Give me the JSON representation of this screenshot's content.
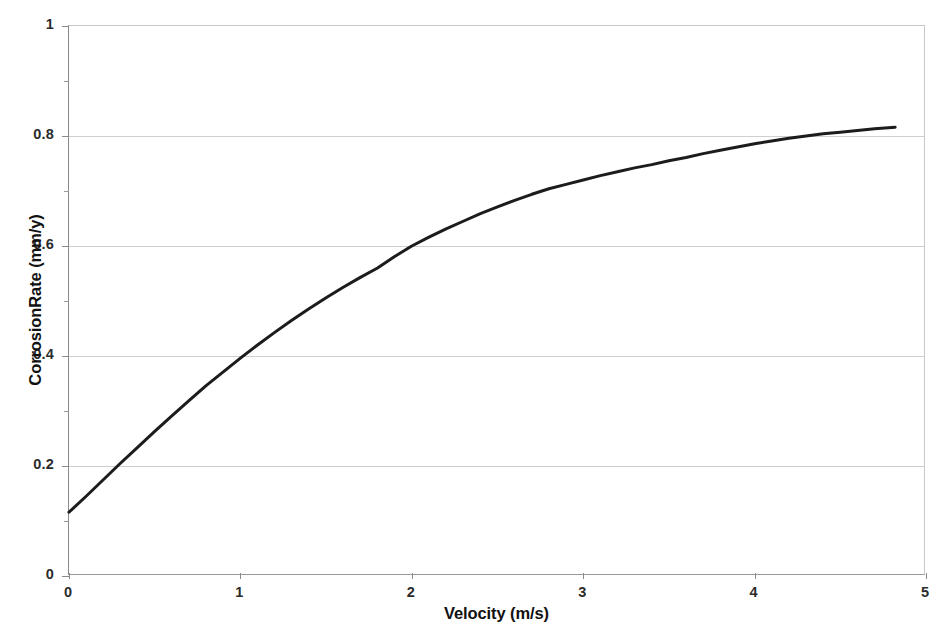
{
  "chart_data": {
    "type": "line",
    "title": "",
    "xlabel": "Velocity (m/s)",
    "ylabel": "CorrosionRate (mm/y)",
    "xlim": [
      0,
      5
    ],
    "ylim": [
      0,
      1
    ],
    "xticks": [
      "0",
      "1",
      "2",
      "3",
      "4",
      "5"
    ],
    "xtick_values": [
      0,
      1,
      2,
      3,
      4,
      5
    ],
    "yticks": [
      "0",
      "0.2",
      "0.4",
      "0.6",
      "0.8",
      "1"
    ],
    "ytick_values": [
      0,
      0.2,
      0.4,
      0.6,
      0.8,
      1
    ],
    "y_minor_ticks": [
      0.1,
      0.3,
      0.5,
      0.7,
      0.9
    ],
    "grid": "horizontal",
    "legend": "none",
    "line_color": "#1c1c1c",
    "line_width": 3,
    "grid_color": "#cfcfcf",
    "background": "#ffffff",
    "series": [
      {
        "name": "Corrosion rate vs velocity",
        "x": [
          0.0,
          0.1,
          0.2,
          0.3,
          0.4,
          0.5,
          0.6,
          0.7,
          0.8,
          0.9,
          1.0,
          1.1,
          1.2,
          1.3,
          1.4,
          1.5,
          1.6,
          1.7,
          1.8,
          1.9,
          2.0,
          2.1,
          2.2,
          2.3,
          2.4,
          2.5,
          2.6,
          2.7,
          2.8,
          2.9,
          3.0,
          3.1,
          3.2,
          3.3,
          3.4,
          3.5,
          3.6,
          3.7,
          3.8,
          3.9,
          4.0,
          4.1,
          4.2,
          4.3,
          4.4,
          4.5,
          4.6,
          4.7,
          4.82
        ],
        "y": [
          0.116,
          0.145,
          0.175,
          0.205,
          0.234,
          0.263,
          0.291,
          0.319,
          0.346,
          0.371,
          0.396,
          0.42,
          0.443,
          0.465,
          0.486,
          0.506,
          0.525,
          0.543,
          0.56,
          0.581,
          0.6,
          0.616,
          0.631,
          0.645,
          0.659,
          0.671,
          0.683,
          0.694,
          0.704,
          0.712,
          0.72,
          0.728,
          0.735,
          0.742,
          0.748,
          0.755,
          0.761,
          0.768,
          0.774,
          0.78,
          0.786,
          0.791,
          0.796,
          0.8,
          0.804,
          0.807,
          0.81,
          0.813,
          0.816
        ]
      }
    ],
    "notable_points": {
      "start": {
        "x": 0,
        "y": 0.12
      },
      "at_v1": {
        "x": 1,
        "y": 0.4
      },
      "at_v2": {
        "x": 2,
        "y": 0.6
      },
      "at_v3": {
        "x": 3,
        "y": 0.72
      },
      "at_v4": {
        "x": 4,
        "y": 0.79
      },
      "end": {
        "x": 4.82,
        "y": 0.82
      }
    }
  }
}
